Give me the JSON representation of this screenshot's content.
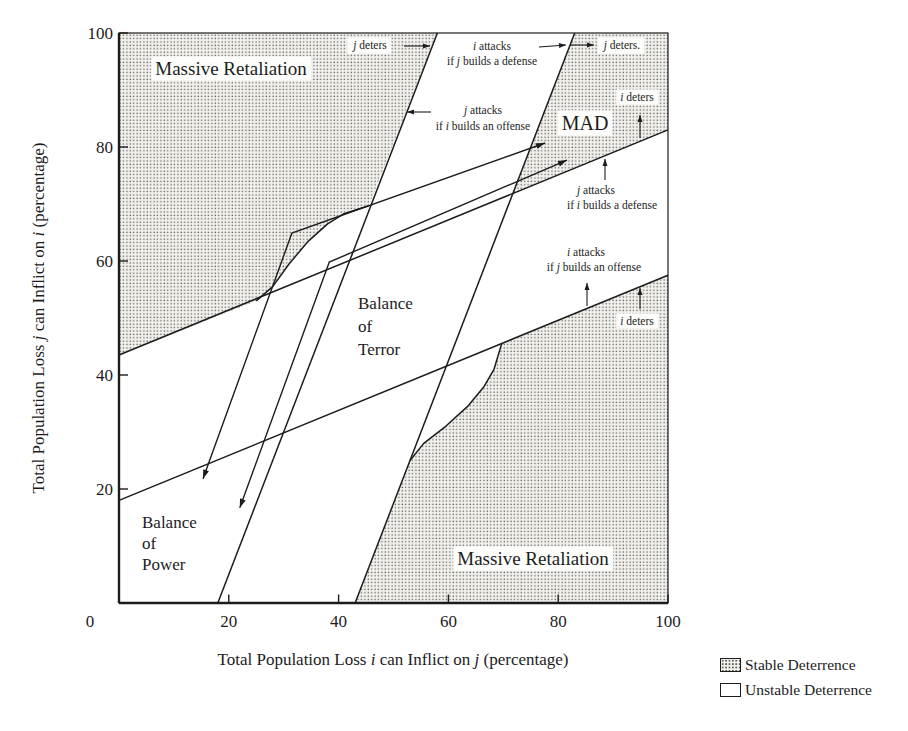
{
  "legend": {
    "items": [
      {
        "label": "Stable Deterrence",
        "swatch": "stipple"
      },
      {
        "label": "Unstable Deterrence",
        "swatch": "white"
      }
    ]
  },
  "chart_data": {
    "type": "region-diagram",
    "title": "",
    "xlabel_segs": [
      {
        "t": "Total Population Loss "
      },
      {
        "t": "i",
        "i": true
      },
      {
        "t": " can Inflict on "
      },
      {
        "t": "j",
        "i": true
      },
      {
        "t": " (percentage)"
      }
    ],
    "ylabel_segs": [
      {
        "t": "Total Population Loss "
      },
      {
        "t": "j",
        "i": true
      },
      {
        "t": " can Inflict on "
      },
      {
        "t": "i",
        "i": true
      },
      {
        "t": " (percentage)"
      }
    ],
    "xlim": [
      0,
      100
    ],
    "ylim": [
      0,
      100
    ],
    "grid": false,
    "legend_position": "bottom-right-outside",
    "layout": {
      "x0": 119,
      "y0": 603,
      "xs": 5.49,
      "ys": 5.7,
      "top": 33,
      "right": 668,
      "bottom": 603,
      "left": 119
    },
    "colors": {
      "ink": "#1c1c1c",
      "stipple_base": "#f1f0ec",
      "stipple_dot": "#5f5f58",
      "label_bg": "#fdfdfb",
      "bg": "#ffffff"
    },
    "x_axis": {
      "origin_label": {
        "text": "0",
        "px": 90,
        "py": 627
      },
      "ticks": [
        {
          "v": 20,
          "label": "20"
        },
        {
          "v": 40,
          "label": "40"
        },
        {
          "v": 60,
          "label": "60"
        },
        {
          "v": 80,
          "label": "80"
        },
        {
          "v": 100,
          "label": "100"
        }
      ],
      "label_px": 393,
      "label_py": 665
    },
    "y_axis": {
      "ticks": [
        {
          "v": 20,
          "label": "20"
        },
        {
          "v": 40,
          "label": "40"
        },
        {
          "v": 60,
          "label": "60"
        },
        {
          "v": 80,
          "label": "80"
        },
        {
          "v": 100,
          "label": "100"
        }
      ],
      "label_px": 44,
      "label_py": 318
    },
    "lines": [
      {
        "name": "j-deterrence-line-upper-shallow",
        "pts": [
          [
            0,
            43.5
          ],
          [
            100,
            83
          ]
        ]
      },
      {
        "name": "i-deterrence-line-lower-shallow",
        "pts": [
          [
            0,
            18
          ],
          [
            100,
            57.5
          ]
        ]
      },
      {
        "name": "j-attack-line-left-steep",
        "pts": [
          [
            18,
            0
          ],
          [
            58,
            100
          ]
        ]
      },
      {
        "name": "i-attack-line-right-steep",
        "pts": [
          [
            43,
            0
          ],
          [
            83,
            100
          ]
        ]
      }
    ],
    "boundary_arcs": [
      {
        "name": "upper-left-stipple-boundary-arc",
        "pts": [
          [
            25,
            53
          ],
          [
            28,
            55.5
          ],
          [
            31,
            59.5
          ],
          [
            34.5,
            63.5
          ],
          [
            38,
            66.5
          ],
          [
            41,
            68.3
          ],
          [
            45.5,
            69.7
          ]
        ]
      },
      {
        "name": "lower-right-stipple-boundary-arc",
        "pts": [
          [
            53,
            25
          ],
          [
            55.5,
            28
          ],
          [
            59.5,
            31
          ],
          [
            63.5,
            34.5
          ],
          [
            66.5,
            38
          ],
          [
            68.3,
            41
          ],
          [
            69.7,
            45.5
          ]
        ]
      }
    ],
    "regions": [
      {
        "name": "region-massive-retaliation-upper-left",
        "pts": [
          [
            0,
            100
          ],
          [
            0,
            43.5
          ],
          [
            25,
            53
          ],
          [
            28,
            55.5
          ],
          [
            31,
            59.5
          ],
          [
            34.5,
            63.5
          ],
          [
            38,
            66.5
          ],
          [
            41,
            68.3
          ],
          [
            45.5,
            69.7
          ],
          [
            58,
            100
          ]
        ]
      },
      {
        "name": "region-mad",
        "pts": [
          [
            71.7,
            71.7
          ],
          [
            83,
            100
          ],
          [
            100,
            100
          ],
          [
            100,
            83
          ]
        ]
      },
      {
        "name": "region-massive-retaliation-lower-right",
        "pts": [
          [
            43,
            0
          ],
          [
            100,
            0
          ],
          [
            100,
            57.5
          ],
          [
            69.7,
            45.5
          ],
          [
            68.3,
            41
          ],
          [
            66.5,
            38
          ],
          [
            63.5,
            34.5
          ],
          [
            59.5,
            31
          ],
          [
            55.5,
            28
          ],
          [
            53,
            25
          ]
        ]
      }
    ],
    "trajectories": [
      {
        "name": "arms-race-trajectory-1",
        "pts": [
          [
            15.3,
            21.8
          ],
          [
            31.5,
            64.9
          ],
          [
            77.6,
            80.7
          ]
        ]
      },
      {
        "name": "arms-race-trajectory-2",
        "pts": [
          [
            22.0,
            16.7
          ],
          [
            38.3,
            59.8
          ],
          [
            81.6,
            77.7
          ]
        ]
      }
    ],
    "region_labels": [
      {
        "name": "label-massive-retaliation-upper",
        "size": 19,
        "bg": true,
        "anchor": "middle",
        "lines": [
          {
            "x": 231,
            "y": 75,
            "segs": [
              {
                "t": "Massive Retaliation"
              }
            ]
          }
        ]
      },
      {
        "name": "label-massive-retaliation-lower",
        "size": 19,
        "bg": true,
        "anchor": "middle",
        "lines": [
          {
            "x": 533,
            "y": 565,
            "segs": [
              {
                "t": "Massive Retaliation"
              }
            ]
          }
        ]
      },
      {
        "name": "label-mad",
        "size": 20,
        "bg": true,
        "anchor": "middle",
        "lines": [
          {
            "x": 585,
            "y": 130,
            "segs": [
              {
                "t": "MAD"
              }
            ]
          }
        ]
      },
      {
        "name": "label-balance-of-terror",
        "size": 17,
        "bg": false,
        "anchor": "start",
        "lines": [
          {
            "x": 358,
            "y": 309,
            "segs": [
              {
                "t": "Balance"
              }
            ]
          },
          {
            "x": 358,
            "y": 332,
            "segs": [
              {
                "t": "of"
              }
            ]
          },
          {
            "x": 358,
            "y": 355,
            "segs": [
              {
                "t": "Terror"
              }
            ]
          }
        ]
      },
      {
        "name": "label-balance-of-power",
        "size": 17,
        "bg": false,
        "anchor": "start",
        "lines": [
          {
            "x": 142,
            "y": 528,
            "segs": [
              {
                "t": "Balance"
              }
            ]
          },
          {
            "x": 142,
            "y": 549,
            "segs": [
              {
                "t": "of"
              }
            ]
          },
          {
            "x": 142,
            "y": 570,
            "segs": [
              {
                "t": "Power"
              }
            ]
          }
        ]
      }
    ],
    "annotations": [
      {
        "name": "ann-j-deters-upper-left",
        "size": 11.5,
        "bg": true,
        "anchor": "middle",
        "lines": [
          {
            "x": 370,
            "y": 49,
            "segs": [
              {
                "t": "j",
                "i": true
              },
              {
                "t": " deters"
              }
            ]
          }
        ],
        "arrow": {
          "x1": 404,
          "y1": 46,
          "x2": 430,
          "y2": 46
        }
      },
      {
        "name": "ann-i-attacks-if-j-builds-defense",
        "size": 11.5,
        "bg": false,
        "anchor": "middle",
        "lines": [
          {
            "x": 492,
            "y": 50,
            "segs": [
              {
                "t": "i",
                "i": true
              },
              {
                "t": " attacks"
              }
            ]
          },
          {
            "x": 492,
            "y": 65,
            "segs": [
              {
                "t": "if "
              },
              {
                "t": "j",
                "i": true
              },
              {
                "t": " builds a defense"
              }
            ]
          }
        ],
        "arrow": {
          "x1": 539,
          "y1": 47,
          "x2": 566,
          "y2": 45
        }
      },
      {
        "name": "ann-j-deters-upper-right",
        "size": 11.5,
        "bg": true,
        "anchor": "middle",
        "lines": [
          {
            "x": 622,
            "y": 49,
            "segs": [
              {
                "t": "j",
                "i": true
              },
              {
                "t": " deters."
              }
            ]
          }
        ],
        "arrow": {
          "x1": 570,
          "y1": 45,
          "x2": 594,
          "y2": 45
        }
      },
      {
        "name": "ann-i-deters-top-right",
        "size": 11.5,
        "bg": true,
        "anchor": "middle",
        "lines": [
          {
            "x": 637,
            "y": 101,
            "segs": [
              {
                "t": "i",
                "i": true
              },
              {
                "t": " deters"
              }
            ]
          }
        ],
        "arrow": {
          "x1": 640,
          "y1": 138,
          "x2": 640,
          "y2": 115
        }
      },
      {
        "name": "ann-j-attacks-if-i-builds-offense",
        "size": 11.5,
        "bg": false,
        "anchor": "middle",
        "lines": [
          {
            "x": 483,
            "y": 114,
            "segs": [
              {
                "t": "j",
                "i": true
              },
              {
                "t": " attacks"
              }
            ]
          },
          {
            "x": 483,
            "y": 130,
            "segs": [
              {
                "t": "if "
              },
              {
                "t": "i",
                "i": true
              },
              {
                "t": " builds an offense"
              }
            ]
          }
        ],
        "arrow": {
          "x1": 431,
          "y1": 112,
          "x2": 407,
          "y2": 112
        }
      },
      {
        "name": "ann-j-attacks-if-i-builds-defense",
        "size": 11.5,
        "bg": false,
        "anchor": "middle",
        "lines": [
          {
            "x": 596,
            "y": 194,
            "segs": [
              {
                "t": "j",
                "i": true
              },
              {
                "t": " attacks"
              }
            ]
          },
          {
            "x": 612,
            "y": 209,
            "segs": [
              {
                "t": "if "
              },
              {
                "t": "i",
                "i": true
              },
              {
                "t": " builds a defense"
              }
            ]
          }
        ],
        "arrow": {
          "x1": 605,
          "y1": 180,
          "x2": 605,
          "y2": 159
        }
      },
      {
        "name": "ann-i-attacks-if-j-builds-offense",
        "size": 11.5,
        "bg": false,
        "anchor": "middle",
        "lines": [
          {
            "x": 586,
            "y": 256,
            "segs": [
              {
                "t": "i",
                "i": true
              },
              {
                "t": " attacks"
              }
            ]
          },
          {
            "x": 594,
            "y": 271,
            "segs": [
              {
                "t": "if "
              },
              {
                "t": "j",
                "i": true
              },
              {
                "t": " builds an offense"
              }
            ]
          }
        ],
        "arrow": {
          "x1": 587,
          "y1": 306,
          "x2": 587,
          "y2": 283
        }
      },
      {
        "name": "ann-i-deters-mid-right",
        "size": 11.5,
        "bg": true,
        "anchor": "middle",
        "lines": [
          {
            "x": 637,
            "y": 325,
            "segs": [
              {
                "t": "i",
                "i": true
              },
              {
                "t": " deters"
              }
            ]
          }
        ],
        "arrow": {
          "x1": 640,
          "y1": 309,
          "x2": 640,
          "y2": 288
        }
      }
    ]
  }
}
